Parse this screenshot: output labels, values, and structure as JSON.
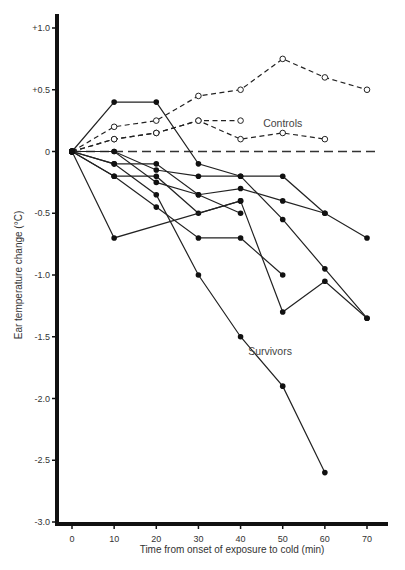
{
  "chart_data": {
    "type": "line",
    "title": "",
    "xlabel": "Time from onset of exposure to cold (min)",
    "ylabel": "Ear temperature change (°C)",
    "xlim": [
      0,
      70
    ],
    "ylim": [
      -3.0,
      1.0
    ],
    "x_ticks": [
      0,
      10,
      20,
      30,
      40,
      50,
      60,
      70
    ],
    "x_tick_labels": [
      "0",
      "10",
      "20",
      "30",
      "40",
      "50",
      "60",
      "70"
    ],
    "y_ticks": [
      1.0,
      0.5,
      0,
      -0.5,
      -1.0,
      -1.5,
      -2.0,
      -2.5,
      -3.0
    ],
    "y_tick_labels": [
      "+1.0",
      "+0.5",
      "0",
      "-0.5",
      "-1.0",
      "-1.5",
      "-2.0",
      "-2.5",
      "-3.0"
    ],
    "grid": false,
    "legend": "none",
    "reference_line": {
      "y": 0,
      "style": "dashed",
      "x_range": [
        0,
        72
      ]
    },
    "annotations": [
      {
        "text": "Controls",
        "x": 50,
        "y": 0.2
      },
      {
        "text": "Survivors",
        "x": 47,
        "y": -1.65
      }
    ],
    "series": [
      {
        "name": "Control 1",
        "group": "Controls",
        "marker": "open-circle",
        "line": "dashed",
        "x": [
          0,
          10,
          20,
          30,
          40,
          50,
          60,
          70
        ],
        "y": [
          0,
          0.2,
          0.25,
          0.45,
          0.5,
          0.75,
          0.6,
          0.5
        ]
      },
      {
        "name": "Control 2",
        "group": "Controls",
        "marker": "open-circle",
        "line": "dashed",
        "x": [
          0,
          10,
          20,
          30,
          40
        ],
        "y": [
          0,
          0.1,
          0.15,
          0.25,
          0.25
        ]
      },
      {
        "name": "Control 3",
        "group": "Controls",
        "marker": "open-circle",
        "line": "dashed",
        "x": [
          0,
          10,
          20,
          30,
          40,
          50,
          60
        ],
        "y": [
          0,
          0.1,
          0.15,
          0.25,
          0.1,
          0.15,
          0.1
        ]
      },
      {
        "name": "Survivor 1",
        "group": "Survivors",
        "marker": "filled-circle",
        "line": "solid",
        "x": [
          0,
          10,
          20,
          30,
          40,
          50,
          60,
          70
        ],
        "y": [
          0,
          0.4,
          0.4,
          -0.1,
          -0.2,
          -0.55,
          -0.95,
          -1.35
        ]
      },
      {
        "name": "Survivor 2",
        "group": "Survivors",
        "marker": "filled-circle",
        "line": "solid",
        "x": [
          0,
          10,
          20,
          30,
          40,
          50,
          60
        ],
        "y": [
          0,
          0,
          -0.15,
          -0.2,
          -0.2,
          -0.2,
          -0.5
        ]
      },
      {
        "name": "Survivor 3",
        "group": "Survivors",
        "marker": "filled-circle",
        "line": "solid",
        "x": [
          0,
          10,
          20,
          30,
          40,
          50,
          60,
          70
        ],
        "y": [
          0,
          0,
          -0.25,
          -0.35,
          -0.3,
          -0.4,
          -0.5,
          -0.7
        ]
      },
      {
        "name": "Survivor 4",
        "group": "Survivors",
        "marker": "filled-circle",
        "line": "solid",
        "x": [
          0,
          10,
          20,
          30,
          40
        ],
        "y": [
          0,
          -0.1,
          -0.1,
          -0.35,
          -0.5
        ]
      },
      {
        "name": "Survivor 5",
        "group": "Survivors",
        "marker": "filled-circle",
        "line": "solid",
        "x": [
          0,
          10,
          20,
          30,
          40,
          50,
          60,
          70
        ],
        "y": [
          0,
          -0.1,
          -0.35,
          -1.0,
          -1.5,
          -1.9,
          -2.6,
          null
        ]
      },
      {
        "name": "Survivor 6",
        "group": "Survivors",
        "marker": "filled-circle",
        "line": "solid",
        "x": [
          0,
          10,
          20,
          30,
          40
        ],
        "y": [
          0,
          -0.2,
          -0.2,
          -0.5,
          -0.4
        ]
      },
      {
        "name": "Survivor 7",
        "group": "Survivors",
        "marker": "filled-circle",
        "line": "solid",
        "x": [
          0,
          10,
          20,
          30,
          40,
          50,
          60,
          70
        ],
        "y": [
          0,
          -0.2,
          -0.45,
          -0.7,
          -0.7,
          -1.0,
          null,
          null
        ]
      },
      {
        "name": "Survivor 8",
        "group": "Survivors",
        "marker": "filled-circle",
        "line": "solid",
        "x": [
          0,
          10,
          40,
          50,
          60,
          70
        ],
        "y": [
          0,
          -0.7,
          -0.4,
          -1.3,
          -1.05,
          -1.35
        ]
      }
    ]
  }
}
